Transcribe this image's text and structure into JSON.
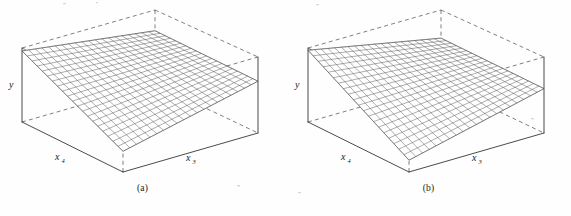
{
  "figure": {
    "kind": "response-surface-pair",
    "background_color": "#fefefe",
    "ink_color": "#2a2a2a",
    "dash_color": "#555555",
    "mesh_color": "#3a3a3a"
  },
  "panels": [
    {
      "id": "a",
      "caption": "(a)",
      "axes": {
        "vertical": {
          "label": "y",
          "sub": ""
        },
        "left_horizontal": {
          "label": "x",
          "sub": "4"
        },
        "right_horizontal": {
          "label": "x",
          "sub": "3"
        }
      },
      "box": {
        "style": "wireframe-cuboid",
        "front_edges": "solid",
        "hidden_edges": "dashed",
        "corners": {
          "top_left": [
            22,
            48
          ],
          "top_back": [
            155,
            10
          ],
          "top_right": [
            258,
            57
          ],
          "top_front": [
            123,
            96
          ],
          "bottom_left": [
            22,
            122
          ],
          "bottom_back": [
            155,
            84
          ],
          "bottom_right": [
            258,
            133
          ],
          "bottom_front": [
            123,
            172
          ]
        }
      },
      "surface": {
        "type": "mesh-grid",
        "grid_u": 20,
        "grid_v": 20,
        "shape": "saddle-tilted-plane",
        "description": "Mesh plane high along the back-left edge, dipping toward the front corner and converging to the right corner",
        "corner_heights": {
          "back_left": 0.96,
          "back_right": 0.72,
          "front_right": 0.7,
          "front_left": 0.28
        }
      }
    },
    {
      "id": "b",
      "caption": "(b)",
      "axes": {
        "vertical": {
          "label": "y",
          "sub": ""
        },
        "left_horizontal": {
          "label": "x",
          "sub": "4"
        },
        "right_horizontal": {
          "label": "x",
          "sub": "3"
        }
      },
      "box": {
        "style": "wireframe-cuboid",
        "front_edges": "solid",
        "hidden_edges": "dashed",
        "corners": {
          "top_left": [
            22,
            48
          ],
          "top_back": [
            155,
            10
          ],
          "top_right": [
            258,
            57
          ],
          "top_front": [
            123,
            96
          ],
          "bottom_left": [
            22,
            122
          ],
          "bottom_back": [
            155,
            84
          ],
          "bottom_right": [
            258,
            133
          ],
          "bottom_front": [
            123,
            172
          ]
        }
      },
      "surface": {
        "type": "mesh-grid",
        "grid_u": 20,
        "grid_v": 20,
        "shape": "tilted-plane",
        "description": "Flat mesh plane tilted so it is highest at the back-left edge and lowest at the front corner",
        "corner_heights": {
          "back_left": 0.97,
          "back_right": 0.62,
          "front_right": 0.6,
          "front_left": 0.16
        }
      }
    }
  ],
  "chart_data": {
    "type": "surface",
    "title": "",
    "subtitle": "",
    "panel_labels": [
      "(a)",
      "(b)"
    ],
    "axis_labels": {
      "x": "x3",
      "y": "x4",
      "z": "y"
    },
    "projection": "isometric-wireframe-box",
    "grid": true,
    "legend": "none",
    "series": [
      {
        "name": "(a) response surface",
        "mesh": {
          "nu": 20,
          "nv": 20
        },
        "corners": {
          "x3_low_x4_low": 0.28,
          "x3_high_x4_low": 0.7,
          "x3_low_x4_high": 0.96,
          "x3_high_x4_high": 0.72
        },
        "note": "surface rises steeply toward low x3 / high x4, nearly level across high x3"
      },
      {
        "name": "(b) response surface",
        "mesh": {
          "nu": 20,
          "nv": 20
        },
        "corners": {
          "x3_low_x4_low": 0.16,
          "x3_high_x4_low": 0.6,
          "x3_low_x4_high": 0.97,
          "x3_high_x4_high": 0.62
        },
        "note": "planar surface, steeper overall tilt than (a)"
      }
    ],
    "zlim": [
      0,
      1
    ],
    "xlim": [
      0,
      1
    ],
    "ylim": [
      0,
      1
    ]
  }
}
